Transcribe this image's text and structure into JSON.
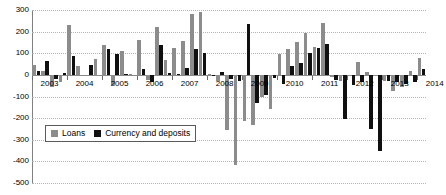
{
  "chart_data": {
    "type": "bar",
    "title": "",
    "subtitle": "",
    "xlabel": "",
    "ylabel": "",
    "ylim": [
      -500,
      300
    ],
    "yticks": [
      300,
      200,
      100,
      0,
      -100,
      -200,
      -300,
      -400,
      -500
    ],
    "ytick_labels": [
      "300",
      "200",
      "100",
      "0",
      "-100",
      "-200",
      "-300",
      "-400",
      "-500"
    ],
    "grid": true,
    "grid_axis": "y",
    "legend_position": "inside-lower-left",
    "bar_mode": "grouped",
    "categories": [
      "2003Q1",
      "2003Q2",
      "2003Q3",
      "2003Q4",
      "2004Q1",
      "2004Q2",
      "2004Q3",
      "2004Q4",
      "2005Q1",
      "2005Q2",
      "2005Q3",
      "2005Q4",
      "2006Q1",
      "2006Q2",
      "2006Q3",
      "2006Q4",
      "2007Q1",
      "2007Q2",
      "2007Q3",
      "2007Q4",
      "2008Q1",
      "2008Q2",
      "2008Q3",
      "2008Q4",
      "2009Q1",
      "2009Q2",
      "2009Q3",
      "2009Q4",
      "2010Q1",
      "2010Q2",
      "2010Q3",
      "2010Q4",
      "2011Q1",
      "2011Q2",
      "2011Q3",
      "2011Q4",
      "2012Q1",
      "2012Q2",
      "2012Q3",
      "2012Q4",
      "2013Q1",
      "2013Q2",
      "2013Q3",
      "2013Q4",
      "2014Q1"
    ],
    "xtick_labels": [
      "2003",
      "2004",
      "2005",
      "2006",
      "2007",
      "2008",
      "2009",
      "2010",
      "2011",
      "2012",
      "2013",
      "2014"
    ],
    "series": [
      {
        "name": "Loans",
        "color": "#8c8c8c",
        "values": [
          45,
          20,
          -55,
          -35,
          230,
          40,
          0,
          75,
          140,
          -45,
          110,
          5,
          160,
          -25,
          220,
          70,
          125,
          155,
          280,
          290,
          5,
          -30,
          -255,
          -415,
          -215,
          -230,
          -100,
          -160,
          95,
          120,
          150,
          195,
          130,
          240,
          -10,
          -30,
          -5,
          60,
          15,
          -5,
          -30,
          -75,
          -55,
          20,
          80
        ]
      },
      {
        "name": "Currency and deposits",
        "color": "#101010",
        "values": [
          20,
          65,
          -20,
          10,
          85,
          0,
          45,
          0,
          120,
          95,
          5,
          0,
          25,
          -35,
          140,
          10,
          5,
          30,
          120,
          100,
          -5,
          15,
          -20,
          -30,
          235,
          -130,
          -95,
          -15,
          -40,
          40,
          55,
          100,
          125,
          145,
          -25,
          -205,
          -45,
          -35,
          -250,
          -350,
          -30,
          -35,
          -40,
          -35,
          25
        ]
      }
    ]
  },
  "legend": {
    "items": [
      {
        "label": "Loans",
        "color": "#8c8c8c"
      },
      {
        "label": "Currency and deposits",
        "color": "#101010"
      }
    ]
  }
}
